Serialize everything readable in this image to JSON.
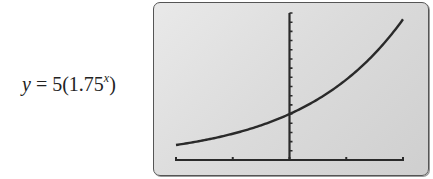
{
  "equation": {
    "lhs": "y",
    "equals": " = 5(1.75",
    "exponent": "x",
    "close": ")"
  },
  "colors": {
    "screen_bg": "#dcdcdc",
    "curve": "#2a2a2a",
    "axis": "#2a2a2a",
    "border": "#555555"
  },
  "chart_data": {
    "type": "line",
    "xlabel": "",
    "ylabel": "",
    "function": "y = 5 * 1.75^x",
    "xlim": [
      -2,
      2
    ],
    "ylim": [
      0,
      16
    ],
    "x_scale": 1,
    "y_scale": 1,
    "grid": false,
    "legend": null,
    "x": [
      -2,
      -1.5,
      -1,
      -0.5,
      0,
      0.5,
      1,
      1.5,
      2
    ],
    "series": [
      {
        "name": "y = 5(1.75^x)",
        "values": [
          1.63,
          2.16,
          2.86,
          3.78,
          5.0,
          6.61,
          8.75,
          11.58,
          15.31
        ]
      }
    ],
    "annotations": [
      "y-intercept at (0, 5)"
    ]
  }
}
